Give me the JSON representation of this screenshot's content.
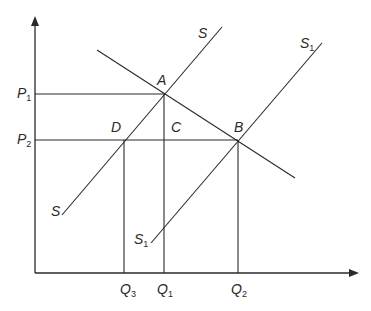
{
  "diagram": {
    "type": "supply-demand shift",
    "colors": {
      "line": "#2a2a2a",
      "background": "#ffffff"
    },
    "axes": {
      "y_axis": {
        "x": 35,
        "y_top": 18,
        "y_bottom": 273
      },
      "x_axis": {
        "y": 273,
        "x_left": 35,
        "x_right": 358
      }
    },
    "curves": {
      "demand": {
        "x1": 97,
        "y1": 50,
        "x2": 295,
        "y2": 178
      },
      "supply_S": {
        "label": "S",
        "x1": 62,
        "y1": 215,
        "x2": 222,
        "y2": 27
      },
      "supply_S1": {
        "label": "S",
        "sub": "1",
        "x1": 151,
        "y1": 243,
        "x2": 322,
        "y2": 43
      }
    },
    "points": {
      "A": {
        "label": "A",
        "x": 164,
        "y": 94
      },
      "B": {
        "label": "B",
        "x": 238,
        "y": 140
      },
      "C": {
        "label": "C",
        "x": 164,
        "y": 140
      },
      "D": {
        "label": "D",
        "x": 124,
        "y": 140
      }
    },
    "price_labels": {
      "P1": {
        "main": "P",
        "sub": "1"
      },
      "P2": {
        "main": "P",
        "sub": "2"
      }
    },
    "quantity_labels": {
      "Q3": {
        "main": "Q",
        "sub": "3"
      },
      "Q1": {
        "main": "Q",
        "sub": "1"
      },
      "Q2": {
        "main": "Q",
        "sub": "2"
      }
    },
    "curve_labels": {
      "S_top": {
        "main": "S"
      },
      "S_bottom": {
        "main": "S"
      },
      "S1_top": {
        "main": "S",
        "sub": "1"
      },
      "S1_bottom": {
        "main": "S",
        "sub": "1"
      }
    }
  }
}
